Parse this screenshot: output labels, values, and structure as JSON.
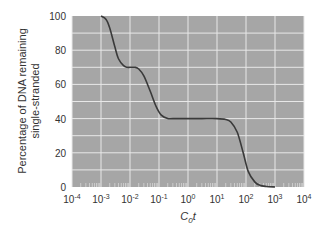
{
  "chart_data": {
    "type": "line",
    "title": "",
    "xlabel": "C0t",
    "xlabel_main": "C",
    "xlabel_sub": "0",
    "xlabel_tail": "t",
    "ylabel_line1": "Percentage of DNA remaining",
    "ylabel_line2": "single-stranded",
    "xscale": "log",
    "xlim": [
      0.0001,
      10000
    ],
    "ylim": [
      0,
      100
    ],
    "grid": true,
    "legend": null,
    "x_tick_labels": [
      {
        "base": "10",
        "exp": "-4"
      },
      {
        "base": "10",
        "exp": "-3"
      },
      {
        "base": "10",
        "exp": "-2"
      },
      {
        "base": "10",
        "exp": "-1"
      },
      {
        "base": "10",
        "exp": "0"
      },
      {
        "base": "10",
        "exp": "1"
      },
      {
        "base": "10",
        "exp": "2"
      },
      {
        "base": "10",
        "exp": "3"
      },
      {
        "base": "10",
        "exp": "4"
      }
    ],
    "y_tick_labels": [
      "0",
      "20",
      "40",
      "60",
      "80",
      "100"
    ],
    "series": [
      {
        "name": "Cot curve",
        "x": [
          0.001,
          0.0015,
          0.002,
          0.003,
          0.004,
          0.006,
          0.008,
          0.01,
          0.015,
          0.02,
          0.03,
          0.05,
          0.08,
          0.12,
          0.2,
          0.3,
          1,
          3,
          10,
          20,
          30,
          50,
          80,
          120,
          200,
          300,
          500,
          1000
        ],
        "y": [
          100,
          98,
          93,
          82,
          75,
          71,
          70,
          70,
          70,
          69,
          65,
          56,
          47,
          42,
          40,
          40,
          40,
          40,
          40,
          39.5,
          38,
          32,
          20,
          9,
          3,
          1,
          0.3,
          0
        ]
      }
    ],
    "colors": {
      "plot_bg": "#a6a6a6",
      "grid": "#e8e8e8",
      "line": "#3a3a3a"
    }
  }
}
